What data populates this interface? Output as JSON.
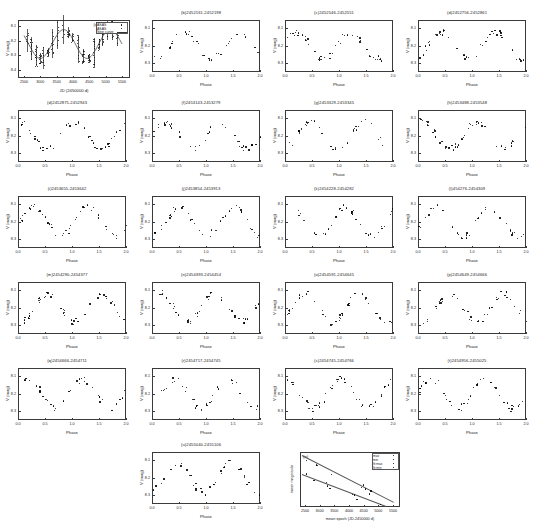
{
  "figure": {
    "panel_count": 22
  },
  "axes_labels": {
    "v_mag": "V (mag)",
    "phase": "Phase",
    "jd": "JD (2450000 d)",
    "mean_epoch": "mean epoch (JD-2450000 d)",
    "mean_mag": "mean magnitude"
  },
  "panel_a": {
    "label": "(a)",
    "xlabel": "JD (2450000 d)",
    "ylabel": "V (mag)",
    "xticks": [
      "2500",
      "3000",
      "3500",
      "4000",
      "4500",
      "5000",
      "5500"
    ],
    "yticks": [
      "8.1",
      "8.2",
      "8.3",
      "8.4"
    ],
    "legend": [
      {
        "name": "ASAS",
        "marker": "point"
      },
      {
        "name": "ASAS",
        "marker": "point"
      },
      {
        "name": "Sine curve",
        "marker": "line"
      }
    ]
  },
  "panel_e": {
    "label": "(e)",
    "xlabel": "mean epoch (JD-2450000 d)",
    "ylabel": "mean magnitude",
    "xticks": [
      "2500",
      "3000",
      "3500",
      "4000",
      "4500",
      "5000",
      "5500"
    ],
    "legend": [
      {
        "name": "max"
      },
      {
        "name": "min"
      },
      {
        "name": "fit max"
      },
      {
        "name": "fit min"
      }
    ]
  },
  "common": {
    "xlabel": "Phase",
    "ylabel": "V (mag)",
    "xticks": [
      "0.0",
      "0.5",
      "1.0",
      "1.5",
      "2.0"
    ],
    "yticks": [
      "8.1",
      "8.2",
      "8.3"
    ]
  },
  "panels": [
    {
      "id": "b",
      "title": "(b)2452161-2452198"
    },
    {
      "id": "c",
      "title": "(c)2452546-2452551"
    },
    {
      "id": "d2",
      "title": "(d)2452756-2452861"
    },
    {
      "id": "d",
      "title": "(d)2452875-2452943"
    },
    {
      "id": "f",
      "title": "(f)2453143-2453279"
    },
    {
      "id": "g",
      "title": "(g)2453329-2453345"
    },
    {
      "id": "h",
      "title": "(h)2453488-2453548"
    },
    {
      "id": "i",
      "title": "(i)2453655-2453642"
    },
    {
      "id": "j",
      "title": "(j)2453854-2453913"
    },
    {
      "id": "k",
      "title": "(k)2454228-2454282"
    },
    {
      "id": "l",
      "title": "(l)454276-2454309"
    },
    {
      "id": "m",
      "title": "(m)2454290-2454377"
    },
    {
      "id": "n",
      "title": "(n)2454393-2454454"
    },
    {
      "id": "o",
      "title": "(o)2454591-2454645"
    },
    {
      "id": "p",
      "title": "(p)2454649-2454666"
    },
    {
      "id": "q",
      "title": "(q)2454666-2454711"
    },
    {
      "id": "r",
      "title": "(r)2454717-2454745"
    },
    {
      "id": "s",
      "title": "(s)2454745-2454766"
    },
    {
      "id": "t",
      "title": "(t)2454956-2455025"
    },
    {
      "id": "u",
      "title": "(u)2455040-2455106"
    }
  ],
  "chart_data": {
    "type": "scatter",
    "xlabel": "Phase",
    "ylabel": "V (mag)",
    "xlim": [
      -0.05,
      2.1
    ],
    "ylim_mag": [
      8.35,
      8.05
    ],
    "grid": false,
    "note": "y axis inverted (magnitudes), 0.0-2.0 phase duplicated cycle",
    "panels": [
      {
        "id": "a",
        "type": "scatter",
        "title": "(a)",
        "xlabel": "JD (2450000 d)",
        "ylabel": "V (mag)",
        "xlim": [
          2300,
          5700
        ],
        "ylim": [
          8.45,
          8.05
        ],
        "xticks": [
          2500,
          3000,
          3500,
          4000,
          4500,
          5000,
          5500
        ],
        "yticks": [
          8.1,
          8.2,
          8.3,
          8.4
        ],
        "series": [
          {
            "name": "ASAS",
            "x": [
              2380,
              2450,
              2560,
              2760,
              2880,
              2950,
              3150,
              3280,
              3340,
              3500,
              3620,
              3860,
              3910,
              4240,
              4300,
              4390,
              4450,
              4600,
              4660,
              4720,
              4960,
              5030,
              5100,
              5400,
              5550
            ],
            "y": [
              8.22,
              8.2,
              8.18,
              8.16,
              8.17,
              8.19,
              8.21,
              8.24,
              8.26,
              8.27,
              8.28,
              8.29,
              8.28,
              8.26,
              8.24,
              8.22,
              8.21,
              8.2,
              8.19,
              8.19,
              8.18,
              8.18,
              8.17,
              8.16,
              8.15
            ]
          },
          {
            "name": "Sine curve",
            "kind": "line",
            "x": [
              2300,
              2700,
              3100,
              3500,
              3900,
              4300,
              4700,
              5100,
              5500,
              5700
            ],
            "y": [
              8.205,
              8.165,
              8.215,
              8.275,
              8.285,
              8.235,
              8.195,
              8.185,
              8.165,
              8.155
            ]
          }
        ]
      },
      {
        "id": "e",
        "type": "scatter",
        "title": "(e)",
        "xlabel": "mean epoch (JD-2450000 d)",
        "ylabel": "mean magnitude",
        "xlim": [
          2300,
          5600
        ],
        "xticks": [
          2500,
          3000,
          3500,
          4000,
          4500,
          5000,
          5500
        ],
        "series": [
          {
            "name": "max",
            "x": [
              2400,
              2900,
              3300,
              3700,
              4200,
              4500,
              4800,
              5100
            ],
            "y": [
              8.13,
              8.15,
              8.17,
              8.2,
              8.23,
              8.25,
              8.27,
              8.3
            ]
          },
          {
            "name": "min",
            "x": [
              2400,
              2800,
              3300,
              3800,
              4300,
              4800,
              5200
            ],
            "y": [
              8.25,
              8.27,
              8.29,
              8.31,
              8.33,
              8.35,
              8.37
            ]
          },
          {
            "name": "fit max",
            "kind": "line",
            "x": [
              2350,
              5550
            ],
            "y": [
              8.11,
              8.33
            ]
          },
          {
            "name": "fit min",
            "kind": "line",
            "x": [
              2350,
              5550
            ],
            "y": [
              8.23,
              8.4
            ]
          }
        ]
      }
    ]
  }
}
